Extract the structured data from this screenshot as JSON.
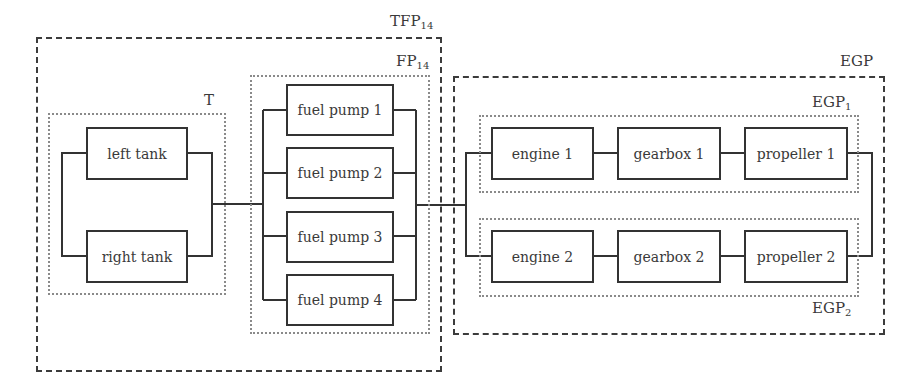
{
  "diagram": {
    "type": "reliability-block-diagram",
    "groups": {
      "tfp": {
        "label": "TFP",
        "subscript": "14"
      },
      "t": {
        "label": "T",
        "subscript": ""
      },
      "fp": {
        "label": "FP",
        "subscript": "14"
      },
      "egp": {
        "label": "EGP",
        "subscript": ""
      },
      "egp1": {
        "label": "EGP",
        "subscript": "1"
      },
      "egp2": {
        "label": "EGP",
        "subscript": "2"
      }
    },
    "blocks": {
      "left_tank": "left tank",
      "right_tank": "right tank",
      "fuel_pump_1": "fuel pump 1",
      "fuel_pump_2": "fuel pump 2",
      "fuel_pump_3": "fuel pump 3",
      "fuel_pump_4": "fuel pump 4",
      "engine_1": "engine 1",
      "gearbox_1": "gearbox 1",
      "propeller_1": "propeller 1",
      "engine_2": "engine 2",
      "gearbox_2": "gearbox 2",
      "propeller_2": "propeller 2"
    },
    "structure": {
      "T": {
        "type": "parallel",
        "members": [
          "left tank",
          "right tank"
        ]
      },
      "FP14": {
        "type": "parallel",
        "members": [
          "fuel pump 1",
          "fuel pump 2",
          "fuel pump 3",
          "fuel pump 4"
        ]
      },
      "TFP14": {
        "type": "series",
        "members": [
          "T",
          "FP14"
        ]
      },
      "EGP1": {
        "type": "series",
        "members": [
          "engine 1",
          "gearbox 1",
          "propeller 1"
        ]
      },
      "EGP2": {
        "type": "series",
        "members": [
          "engine 2",
          "gearbox 2",
          "propeller 2"
        ]
      },
      "EGP": {
        "type": "parallel",
        "members": [
          "EGP1",
          "EGP2"
        ]
      },
      "system": {
        "type": "series",
        "members": [
          "TFP14",
          "EGP"
        ]
      }
    }
  }
}
